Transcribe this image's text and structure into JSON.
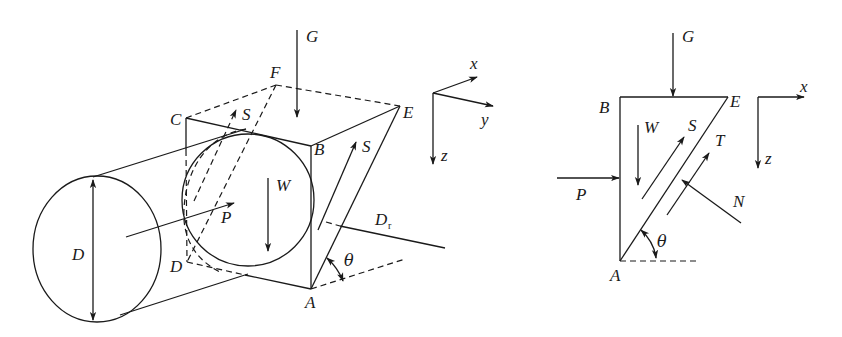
{
  "figure": {
    "left_panel": {
      "description": "3D view of cylinder entering wedge-shaped block",
      "labels": {
        "G": "G",
        "F": "F",
        "C": "C",
        "E": "E",
        "B": "B",
        "A": "A",
        "D_prime": "D",
        "D_diameter": "D",
        "S_top": "S",
        "S_right": "S",
        "W": "W",
        "P": "P",
        "Dr": "D",
        "Dr_sub": "r",
        "theta": "θ"
      },
      "axes": {
        "x": "x",
        "y": "y",
        "z": "z"
      }
    },
    "right_panel": {
      "description": "2D free body diagram of wedge",
      "labels": {
        "G": "G",
        "B": "B",
        "E": "E",
        "A": "A",
        "W": "W",
        "S": "S",
        "T": "T",
        "P": "P",
        "N": "N",
        "theta": "θ"
      },
      "axes": {
        "x": "x",
        "z": "z"
      }
    },
    "colors": {
      "stroke": "#1a1a1a",
      "background": "#ffffff"
    }
  }
}
